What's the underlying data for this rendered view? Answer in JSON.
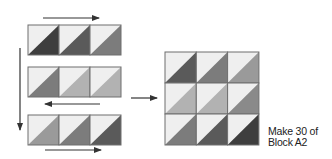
{
  "diagram": {
    "caption": {
      "line1": "Make 30 of",
      "line2": "Block A2"
    },
    "colors": {
      "light": "#efefef",
      "border": "#6e6e6e",
      "arrow": "#333333",
      "shades": {
        "d1": "#3e3e3e",
        "d2": "#5a5a5a",
        "d3": "#7c7c7c",
        "d4": "#9a9a9a",
        "d5": "#b2b2b2",
        "d6": "#8a8a8a"
      }
    },
    "rows": [
      {
        "label": "row-1",
        "direction": "right",
        "units": [
          "d1",
          "d2",
          "d3"
        ]
      },
      {
        "label": "row-2",
        "direction": "left",
        "units": [
          "d3",
          "d5",
          "d5"
        ]
      },
      {
        "label": "row-3",
        "direction": "right",
        "units": [
          "d4",
          "d3",
          "d2"
        ]
      }
    ],
    "final_block": {
      "name": "Block A2",
      "grid": [
        [
          "d2",
          "d3",
          "d4"
        ],
        [
          "d5",
          "d5",
          "d6"
        ],
        [
          "d3",
          "d2",
          "d1"
        ]
      ]
    }
  }
}
